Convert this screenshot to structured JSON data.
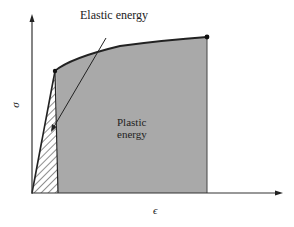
{
  "diagram": {
    "type": "stress-strain energy diagram",
    "labels": {
      "elastic": "Elastic energy",
      "plastic_line1": "Plastic",
      "plastic_line2": "energy",
      "y_axis": "σ",
      "x_axis": "ϵ"
    },
    "colors": {
      "plastic_fill": "#a9a9a9",
      "lines": "#222222",
      "background": "#ffffff"
    },
    "regions": [
      {
        "name": "elastic-energy",
        "style": "hatched"
      },
      {
        "name": "plastic-energy",
        "style": "gray-fill"
      }
    ]
  }
}
